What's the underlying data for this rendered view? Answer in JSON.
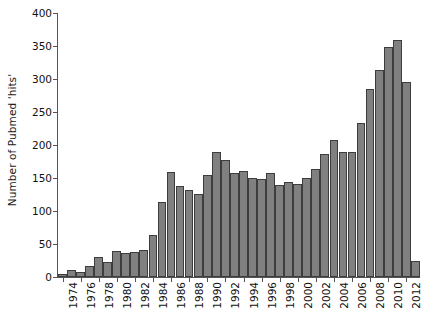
{
  "chart_data": {
    "type": "bar",
    "title": "",
    "xlabel": "",
    "ylabel": "Number of Pubmed 'hits'",
    "ylim": [
      0,
      400
    ],
    "xlim": [
      1973.5,
      2013.5
    ],
    "grid": false,
    "legend": null,
    "bar_color": "#808080",
    "bar_edge_color": "#3d3d3d",
    "axis_color": "#555555",
    "background": "#ffffff",
    "y_ticks": [
      0,
      50,
      100,
      150,
      200,
      250,
      300,
      350,
      400
    ],
    "y_tick_labels": [
      "0",
      "50",
      "100",
      "150",
      "200",
      "250",
      "300",
      "350",
      "400"
    ],
    "x_tick_labels": [
      "1974",
      "1976",
      "1978",
      "1980",
      "1982",
      "1984",
      "1986",
      "1988",
      "1990",
      "1992",
      "1994",
      "1996",
      "1998",
      "2000",
      "2002",
      "2004",
      "2006",
      "2008",
      "2010",
      "2012"
    ],
    "categories": [
      "1974",
      "1975",
      "1976",
      "1977",
      "1978",
      "1979",
      "1980",
      "1981",
      "1982",
      "1983",
      "1984",
      "1985",
      "1986",
      "1987",
      "1988",
      "1989",
      "1990",
      "1991",
      "1992",
      "1993",
      "1994",
      "1995",
      "1996",
      "1997",
      "1998",
      "1999",
      "2000",
      "2001",
      "2002",
      "2003",
      "2004",
      "2005",
      "2006",
      "2007",
      "2008",
      "2009",
      "2010",
      "2011",
      "2012",
      "2013"
    ],
    "values": [
      4,
      10,
      8,
      17,
      31,
      22,
      39,
      37,
      38,
      41,
      64,
      114,
      159,
      138,
      132,
      126,
      155,
      190,
      178,
      158,
      160,
      150,
      149,
      157,
      140,
      144,
      141,
      150,
      164,
      186,
      208,
      189,
      189,
      234,
      285,
      313,
      348,
      359,
      296,
      25
    ]
  }
}
